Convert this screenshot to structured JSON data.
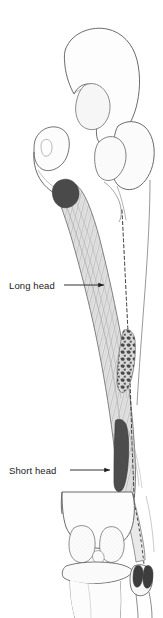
{
  "figure": {
    "view": "posterior",
    "cropped_header_text": "in the norm and/or lesion",
    "labels": [
      {
        "id": "long-head",
        "text": "Long head",
        "text_x": 9,
        "text_y": 280,
        "leader_from_x": 64,
        "leader_to_x": 104,
        "leader_y": 285,
        "arrow": "right"
      },
      {
        "id": "short-head",
        "text": "Short head",
        "text_x": 9,
        "text_y": 465,
        "leader_from_x": 70,
        "leader_to_x": 110,
        "leader_y": 470,
        "arrow": "right"
      }
    ],
    "structures": [
      {
        "name": "ilium",
        "kind": "bone"
      },
      {
        "name": "sacrum",
        "kind": "bone"
      },
      {
        "name": "ischial-tuberosity",
        "kind": "bone"
      },
      {
        "name": "greater-trochanter",
        "kind": "bone"
      },
      {
        "name": "femoral-neck",
        "kind": "bone"
      },
      {
        "name": "femur-shaft",
        "kind": "bone",
        "style": "hidden-dashed"
      },
      {
        "name": "femoral-condyles",
        "kind": "bone"
      },
      {
        "name": "patella",
        "kind": "bone"
      },
      {
        "name": "tibia",
        "kind": "bone"
      },
      {
        "name": "fibula",
        "kind": "bone"
      },
      {
        "name": "biceps-femoris-long-head",
        "kind": "muscle",
        "texture": "striated"
      },
      {
        "name": "biceps-femoris-short-head",
        "kind": "muscle",
        "texture": "solid-dark"
      },
      {
        "name": "long-head-origin-marker",
        "kind": "attachment"
      },
      {
        "name": "short-head-origin-marker",
        "kind": "attachment"
      },
      {
        "name": "fibular-head-insertion-marker",
        "kind": "attachment"
      }
    ],
    "colors": {
      "background": "#ffffff",
      "bone_outline": "#5a5a5a",
      "bone_fill": "#fdfdfd",
      "bone_fill_shaded": "#f4f4f4",
      "muscle_outline": "#6e6e6e",
      "muscle_fill": "#e3e3e3",
      "muscle_fiber": "#9a9a9a",
      "origin_dark": "#4a4a4a",
      "attachment_dark": "#3d3d3d",
      "dashed_line": "#3a3a3a",
      "label_text": "#1b1b1b",
      "leader_line": "#1b1b1b",
      "cropped_header": "#b9b9b9"
    }
  }
}
